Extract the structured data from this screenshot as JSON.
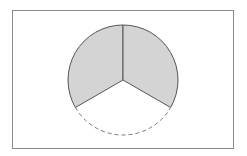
{
  "diagram": {
    "type": "circle-sectors",
    "frame": {
      "x": 12.5,
      "y": 10.5,
      "width": 221,
      "height": 138,
      "stroke": "#8a8a8a"
    },
    "circle": {
      "cx": 123,
      "cy": 80,
      "r": 55
    },
    "sectors": [
      {
        "name": "upper-left",
        "start_deg": 90,
        "end_deg": 210,
        "shaded": true,
        "fill": "#d4d4d4"
      },
      {
        "name": "upper-right",
        "start_deg": -30,
        "end_deg": 90,
        "shaded": true,
        "fill": "#d4d4d4"
      },
      {
        "name": "bottom",
        "start_deg": 210,
        "end_deg": 330,
        "shaded": false,
        "arc_style": "dashed"
      }
    ],
    "stroke_color": "#555555",
    "dash_color": "#777777"
  }
}
